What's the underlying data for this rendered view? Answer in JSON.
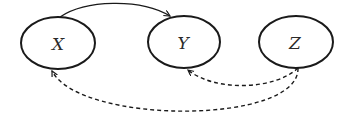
{
  "diagram": {
    "type": "causal-graph",
    "nodes": [
      {
        "id": "X",
        "label": "X",
        "cx": 58,
        "cy": 43,
        "rx": 37,
        "ry": 26
      },
      {
        "id": "Y",
        "label": "Y",
        "cx": 184,
        "cy": 42,
        "rx": 36,
        "ry": 26
      },
      {
        "id": "Z",
        "label": "Z",
        "cx": 296,
        "cy": 42,
        "rx": 37,
        "ry": 26
      }
    ],
    "edges": [
      {
        "from": "X",
        "to": "Y",
        "style": "solid",
        "directed": true,
        "curve": "above"
      },
      {
        "from": "Z",
        "to": "Y",
        "style": "dashed",
        "directed": true,
        "curve": "below"
      },
      {
        "from": "Z",
        "to": "X",
        "style": "dashed",
        "directed": true,
        "curve": "below"
      }
    ],
    "colors": {
      "stroke": "#1a1a1a",
      "background": "#ffffff"
    }
  }
}
